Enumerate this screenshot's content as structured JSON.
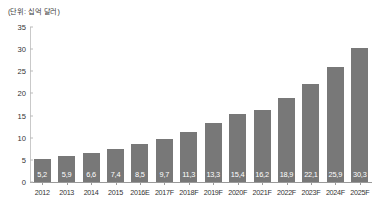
{
  "chart_data": {
    "type": "bar",
    "title": "",
    "unit_label": "(단위: 십억 달러)",
    "xlabel": "",
    "ylabel": "",
    "ylim": [
      0,
      35
    ],
    "yticks": [
      0,
      5,
      10,
      15,
      20,
      25,
      30,
      35
    ],
    "grid": false,
    "legend": null,
    "bar_color": "#787878",
    "value_label_color": "#ffffff",
    "axis_color": "#9a9a9a",
    "categories": [
      "2012",
      "2013",
      "2014",
      "2015",
      "2016E",
      "2017F",
      "2018F",
      "2019F",
      "2020F",
      "2021F",
      "2022F",
      "2023F",
      "2024F",
      "2025F"
    ],
    "values": [
      5.2,
      5.9,
      6.6,
      7.4,
      8.5,
      9.7,
      11.3,
      13.3,
      15.4,
      16.2,
      18.9,
      22.1,
      25.9,
      30.3
    ],
    "value_labels": [
      "5,2",
      "5,9",
      "6,6",
      "7,4",
      "8,5",
      "9,7",
      "11,3",
      "13,3",
      "15,4",
      "16,2",
      "18,9",
      "22,1",
      "25,9",
      "30,3"
    ]
  }
}
